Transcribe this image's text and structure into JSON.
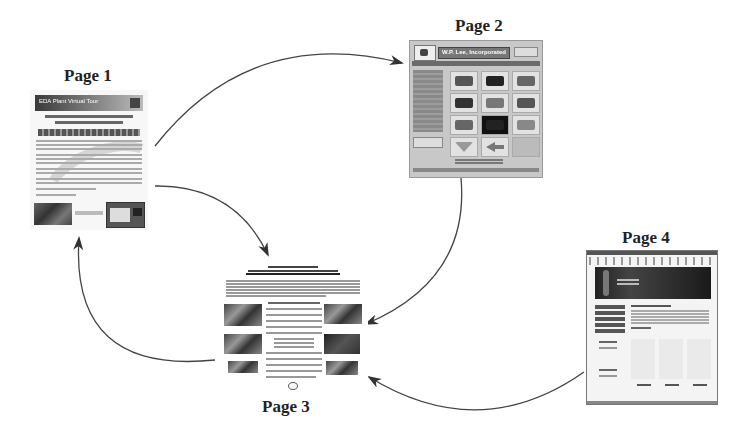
{
  "diagram": {
    "type": "cyclic page-navigation diagram",
    "nodes": [
      {
        "id": "page1",
        "label": "Page 1",
        "thumbnail": {
          "header_text": "EDA Plant Virtual Tour",
          "description": "flyer page with banner header, title text, faded flag graphic, two small images at bottom"
        }
      },
      {
        "id": "page2",
        "label": "Page 2",
        "thumbnail": {
          "header_text": "W.P. Lee, Incorporated",
          "description": "grey web page with logo, nav sidebar and 3x4 grid of image tiles"
        }
      },
      {
        "id": "page3",
        "label": "Page 3",
        "thumbnail": {
          "description": "document page with headline, paragraphs, photos on left and right columns"
        }
      },
      {
        "id": "page4",
        "label": "Page 4",
        "thumbnail": {
          "description": "browser window screenshot with dark hero banner, left nav and three content columns"
        }
      }
    ],
    "edges": [
      {
        "from": "page1",
        "to": "page2"
      },
      {
        "from": "page1",
        "to": "page3"
      },
      {
        "from": "page2",
        "to": "page3"
      },
      {
        "from": "page3",
        "to": "page1"
      },
      {
        "from": "page4",
        "to": "page3"
      }
    ],
    "colors": {
      "arrow": "#333333",
      "label": "#222222",
      "background": "#ffffff"
    }
  }
}
